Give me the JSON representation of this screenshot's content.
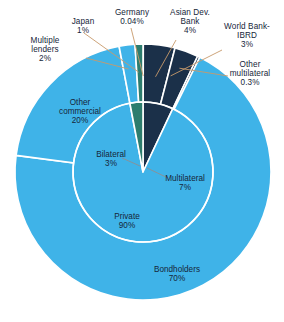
{
  "chart_data": {
    "type": "pie",
    "title": "",
    "subtitle": "",
    "xlabel": "",
    "ylabel": "",
    "legend_position": "none",
    "grid": false,
    "layout": "nested-donut",
    "center_x": 143,
    "center_y": 172,
    "outer_radius": 128,
    "inner_radius": 70,
    "start_angle_deg": 0,
    "direction": "clockwise",
    "colors": {
      "private": "#3fb3e8",
      "multilateral": "#1b3049",
      "bilateral": "#2d7d6e",
      "separator": "#ffffff",
      "label_text": "#16263a",
      "leader_line": "#c79a6b",
      "background": "#ffffff"
    },
    "rings": [
      {
        "name": "inner",
        "categories": [
          "Multilateral",
          "Private",
          "Bilateral"
        ],
        "values": [
          7,
          90,
          3
        ],
        "value_labels": [
          "7%",
          "90%",
          "3%"
        ],
        "colors": [
          "#1b3049",
          "#3fb3e8",
          "#2d7d6e"
        ]
      },
      {
        "name": "outer",
        "categories": [
          "Germany",
          "Asian Dev. Bank",
          "World Bank-IBRD",
          "Other multilateral",
          "Bondholders",
          "Other commercial",
          "Multiple lenders",
          "Japan"
        ],
        "values": [
          0.04,
          4,
          3,
          0.3,
          70,
          20,
          2,
          1
        ],
        "value_labels": [
          "0.04%",
          "4%",
          "3%",
          "0.3%",
          "70%",
          "20%",
          "2%",
          "1%"
        ],
        "colors": [
          "#2d7d6e",
          "#1b3049",
          "#1b3049",
          "#1b3049",
          "#3fb3e8",
          "#3fb3e8",
          "#3fb3e8",
          "#2d7d6e"
        ]
      }
    ]
  },
  "callouts": [
    {
      "key": "multiple_lenders",
      "label": "Multiple\nlenders",
      "line1": "Multiple",
      "line2": "lenders",
      "value": "2%"
    },
    {
      "key": "japan",
      "label": "Japan",
      "line1": "Japan",
      "line2": "",
      "value": "1%"
    },
    {
      "key": "germany",
      "label": "Germany",
      "line1": "Germany",
      "line2": "",
      "value": "0.04%"
    },
    {
      "key": "asian_dev_bank",
      "label": "Asian Dev.\nBank",
      "line1": "Asian Dev.",
      "line2": "Bank",
      "value": "4%"
    },
    {
      "key": "world_bank_ibrd",
      "label": "World Bank-\nIBRD",
      "line1": "World Bank-",
      "line2": "IBRD",
      "value": "3%"
    },
    {
      "key": "other_multilateral",
      "label": "Other\nmultilateral",
      "line1": "Other",
      "line2": "multilateral",
      "value": "0.3%"
    }
  ],
  "inpie_labels": [
    {
      "key": "other_commercial",
      "line1": "Other",
      "line2": "commercial",
      "value": "20%"
    },
    {
      "key": "bondholders",
      "line1": "Bondholders",
      "line2": "",
      "value": "70%"
    },
    {
      "key": "bilateral",
      "line1": "Bilateral",
      "line2": "",
      "value": "3%"
    },
    {
      "key": "multilateral",
      "line1": "Multilateral",
      "line2": "",
      "value": "7%"
    },
    {
      "key": "private",
      "line1": "Private",
      "line2": "",
      "value": "90%"
    }
  ]
}
